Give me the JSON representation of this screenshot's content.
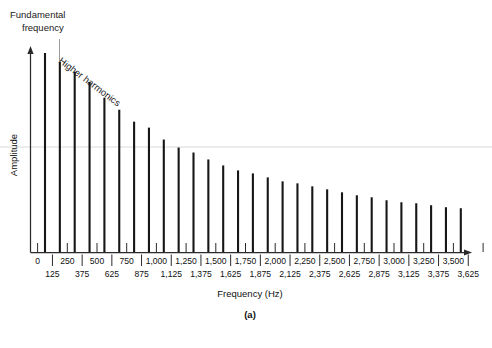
{
  "figure": {
    "panel_label": "(a)",
    "annotations": {
      "fundamental": "Fundamental\nfrequency",
      "fundamental_line1": "Fundamental",
      "fundamental_line2": "frequency",
      "higher_harmonics": "Higher harmonics"
    },
    "colors": {
      "bar": "#161616",
      "axis": "#2a2a2a",
      "leader": "#9a9a9a",
      "artifact": "#d8dade",
      "background": "#ffffff",
      "text": "#111111"
    }
  },
  "chart_data": {
    "type": "bar",
    "title": "",
    "subtitle": "",
    "xlabel": "Frequency (Hz)",
    "ylabel": "Amplitude",
    "grid": false,
    "legend": "none",
    "xlim": [
      0,
      3750
    ],
    "ylim": [
      0,
      1
    ],
    "note": "Harmonic spectrum of a complex periodic sound; amplitude decreases as harmonic number increases.",
    "x_tick_labels_upper": [
      "0",
      "250",
      "500",
      "750",
      "1,000",
      "1,250",
      "1,500",
      "1,750",
      "2,000",
      "2,250",
      "2,500",
      "2,750",
      "3,000",
      "3,250",
      "3,500"
    ],
    "x_tick_labels_lower": [
      "125",
      "375",
      "625",
      "875",
      "1,125",
      "1,375",
      "1,625",
      "1,875",
      "2,125",
      "2,375",
      "2,625",
      "2,875",
      "3,125",
      "3,375",
      "3,625"
    ],
    "categories": [
      125,
      250,
      375,
      500,
      625,
      750,
      875,
      1000,
      1125,
      1250,
      1375,
      1500,
      1625,
      1750,
      1875,
      2000,
      2125,
      2250,
      2375,
      2500,
      2625,
      2750,
      2875,
      3000,
      3125,
      3250,
      3375,
      3500,
      3625
    ],
    "values": [
      1.0,
      0.955,
      0.905,
      0.855,
      0.775,
      0.715,
      0.655,
      0.625,
      0.565,
      0.525,
      0.5,
      0.465,
      0.435,
      0.41,
      0.395,
      0.375,
      0.355,
      0.345,
      0.33,
      0.315,
      0.3,
      0.285,
      0.275,
      0.26,
      0.25,
      0.245,
      0.235,
      0.225,
      0.22
    ]
  }
}
